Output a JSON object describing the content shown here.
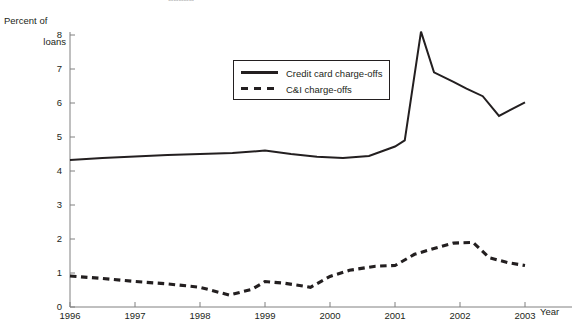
{
  "clipped_title": "aaaaa",
  "axes": {
    "y_title_line1": "Percent of",
    "y_title_line2": "loans",
    "x_title": "Year",
    "y_ticks": [
      "8",
      "7",
      "6",
      "5",
      "4",
      "3",
      "2",
      "1",
      "0"
    ],
    "x_ticks": [
      "1996",
      "1997",
      "1998",
      "1999",
      "2000",
      "2001",
      "2002",
      "2003"
    ]
  },
  "legend": {
    "items": [
      {
        "label": "Credit card charge-offs",
        "style": "solid",
        "swatch": "solid-line-swatch"
      },
      {
        "label": "C&I charge-offs",
        "style": "dashed",
        "swatch": "dashed-line-swatch"
      }
    ]
  },
  "colors": {
    "line": "#231f20",
    "axis": "#808080",
    "background": "#ffffff"
  },
  "chart_data": {
    "type": "line",
    "title": "",
    "subtitle": "",
    "xlabel": "Year",
    "ylabel": "Percent of loans",
    "xlim": [
      1996,
      2003.05
    ],
    "ylim": [
      0,
      8
    ],
    "grid": false,
    "legend_position": "inside-top-center",
    "y_ticks": [
      0,
      1,
      2,
      3,
      4,
      5,
      6,
      7,
      8
    ],
    "x_ticks": [
      1996,
      1997,
      1998,
      1999,
      2000,
      2001,
      2002,
      2003
    ],
    "series": [
      {
        "name": "Credit card charge-offs",
        "style": "solid",
        "color": "#231f20",
        "points": [
          [
            1996.0,
            4.32
          ],
          [
            1996.5,
            4.38
          ],
          [
            1997.0,
            4.43
          ],
          [
            1997.5,
            4.47
          ],
          [
            1998.0,
            4.5
          ],
          [
            1998.5,
            4.53
          ],
          [
            1999.0,
            4.6
          ],
          [
            1999.4,
            4.5
          ],
          [
            1999.8,
            4.42
          ],
          [
            2000.2,
            4.38
          ],
          [
            2000.6,
            4.44
          ],
          [
            2001.0,
            4.72
          ],
          [
            2001.15,
            4.9
          ],
          [
            2001.4,
            8.1
          ],
          [
            2001.6,
            6.9
          ],
          [
            2001.9,
            6.62
          ],
          [
            2002.1,
            6.42
          ],
          [
            2002.35,
            6.2
          ],
          [
            2002.6,
            5.62
          ],
          [
            2003.0,
            6.02
          ]
        ]
      },
      {
        "name": "C&I charge-offs",
        "style": "dashed",
        "color": "#231f20",
        "points": [
          [
            1996.0,
            0.91
          ],
          [
            1996.5,
            0.84
          ],
          [
            1997.0,
            0.75
          ],
          [
            1997.5,
            0.68
          ],
          [
            1998.0,
            0.58
          ],
          [
            1998.45,
            0.35
          ],
          [
            1998.8,
            0.52
          ],
          [
            1999.0,
            0.75
          ],
          [
            1999.3,
            0.7
          ],
          [
            1999.7,
            0.58
          ],
          [
            2000.0,
            0.9
          ],
          [
            2000.3,
            1.08
          ],
          [
            2000.7,
            1.2
          ],
          [
            2001.0,
            1.22
          ],
          [
            2001.3,
            1.55
          ],
          [
            2001.6,
            1.72
          ],
          [
            2001.9,
            1.88
          ],
          [
            2002.2,
            1.9
          ],
          [
            2002.45,
            1.45
          ],
          [
            2002.75,
            1.3
          ],
          [
            2003.0,
            1.22
          ]
        ]
      }
    ]
  }
}
